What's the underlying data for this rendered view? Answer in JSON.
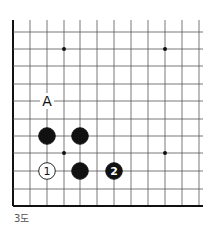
{
  "diagram": {
    "caption": "3도",
    "grid": {
      "x_lines": [
        13,
        30,
        47,
        64,
        80,
        97,
        114,
        131,
        148,
        165,
        182,
        199
      ],
      "y_lines": [
        32,
        49,
        66,
        84,
        101,
        119,
        136,
        153,
        171,
        189,
        206
      ],
      "top_y": 20,
      "right_x": 203,
      "line_color": "#555555",
      "edge_color": "#111111"
    },
    "star_points": [
      [
        64,
        49
      ],
      [
        165,
        49
      ],
      [
        64,
        153
      ],
      [
        165,
        153
      ]
    ],
    "stones": [
      {
        "x": 47,
        "y": 136,
        "color": "black",
        "label": ""
      },
      {
        "x": 80,
        "y": 136,
        "color": "black",
        "label": ""
      },
      {
        "x": 80,
        "y": 171,
        "color": "black",
        "label": ""
      },
      {
        "x": 47,
        "y": 171,
        "color": "white",
        "label": "1"
      },
      {
        "x": 114,
        "y": 171,
        "color": "black",
        "label": "2"
      }
    ],
    "markers": [
      {
        "x": 47,
        "y": 101,
        "label": "A"
      }
    ]
  }
}
